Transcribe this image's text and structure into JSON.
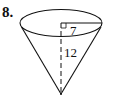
{
  "problem": {
    "number": "8."
  },
  "figure": {
    "shape": "cone",
    "orientation": "inverted",
    "radius_label": "7",
    "height_label": "12",
    "stroke_color": "#111111"
  }
}
